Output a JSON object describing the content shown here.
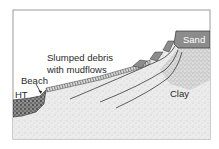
{
  "diagram": {
    "type": "geological cross-section",
    "labels": {
      "sand": "Sand",
      "clay": "Clay",
      "slumped_debris_line1": "Slumped debris",
      "slumped_debris_line2": "with mudflows",
      "beach": "Beach",
      "high_tide": "HT"
    },
    "colors": {
      "frame": "#9a9a9a",
      "sand_fill": "#8c8c8c",
      "clay_fill": "#e9e9e9",
      "beach_fill": "#6d6d6d",
      "line": "#3a3a3a",
      "background": "#ffffff"
    }
  }
}
